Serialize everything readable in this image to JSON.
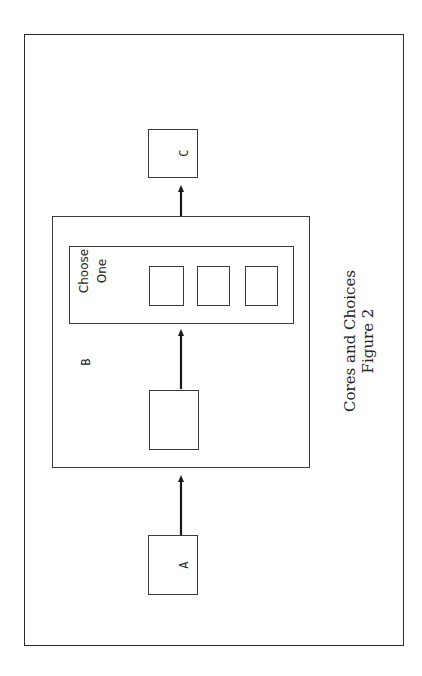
{
  "diagram": {
    "nodes": {
      "a": {
        "label": "A"
      },
      "b": {
        "label": "B"
      },
      "c": {
        "label": "C"
      },
      "choose_group": {
        "label_line1": "Choose",
        "label_line2": "One",
        "options_count": 3
      },
      "b_inner": {
        "label": ""
      }
    },
    "edges": [
      {
        "from": "A",
        "to": "B"
      },
      {
        "from": "B inner box",
        "to": "Choose One group"
      },
      {
        "from": "B",
        "to": "C"
      }
    ],
    "caption": {
      "title": "Cores and Choices",
      "subtitle": "Figure 2"
    },
    "colors": {
      "line": "#2a2a2a",
      "background": "#ffffff"
    }
  }
}
